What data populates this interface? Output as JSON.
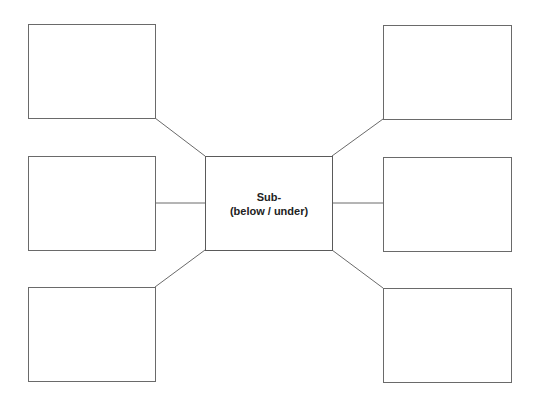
{
  "diagram": {
    "type": "word-web / spider organizer",
    "center": {
      "line1": "Sub-",
      "line2": "(below / under)"
    },
    "outer_boxes": [
      {
        "id": "top-left",
        "text": ""
      },
      {
        "id": "middle-left",
        "text": ""
      },
      {
        "id": "bottom-left",
        "text": ""
      },
      {
        "id": "top-right",
        "text": ""
      },
      {
        "id": "middle-right",
        "text": ""
      },
      {
        "id": "bottom-right",
        "text": ""
      }
    ],
    "colors": {
      "line": "#6a6a6a",
      "text": "#222222",
      "background": "#ffffff"
    }
  }
}
